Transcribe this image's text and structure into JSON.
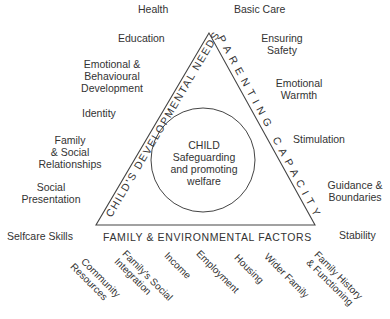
{
  "diagram": {
    "center": {
      "title": "CHILD",
      "line1": "Safeguarding",
      "line2": "and promoting",
      "line3": "welfare"
    },
    "sides": {
      "left": "CHILD'S DEVELOPMENTAL NEEDS",
      "right": "PARENTING CAPACITY",
      "bottom": "FAMILY & ENVIRONMENTAL FACTORS"
    },
    "developmental_needs": [
      {
        "l1": "Health",
        "l2": "",
        "l3": ""
      },
      {
        "l1": "Education",
        "l2": "",
        "l3": ""
      },
      {
        "l1": "Emotional &",
        "l2": "Behavioural",
        "l3": "Development"
      },
      {
        "l1": "Identity",
        "l2": "",
        "l3": ""
      },
      {
        "l1": "Family",
        "l2": "& Social",
        "l3": "Relationships"
      },
      {
        "l1": "Social",
        "l2": "Presentation",
        "l3": ""
      },
      {
        "l1": "Selfcare Skills",
        "l2": "",
        "l3": ""
      }
    ],
    "parenting_capacity": [
      {
        "l1": "Basic Care",
        "l2": ""
      },
      {
        "l1": "Ensuring",
        "l2": "Safety"
      },
      {
        "l1": "Emotional",
        "l2": "Warmth"
      },
      {
        "l1": "Stimulation",
        "l2": ""
      },
      {
        "l1": "Guidance &",
        "l2": "Boundaries"
      },
      {
        "l1": "Stability",
        "l2": ""
      }
    ],
    "family_factors": [
      {
        "l1": "Community",
        "l2": "Resources"
      },
      {
        "l1": "Family's Social",
        "l2": "Integration"
      },
      {
        "l1": "Income",
        "l2": ""
      },
      {
        "l1": "Employment",
        "l2": ""
      },
      {
        "l1": "Housing",
        "l2": ""
      },
      {
        "l1": "Wider Family",
        "l2": ""
      },
      {
        "l1": "Family History",
        "l2": "& Functioning"
      }
    ],
    "colors": {
      "text": "#333333",
      "lines": "#444444",
      "background": "#ffffff"
    }
  }
}
